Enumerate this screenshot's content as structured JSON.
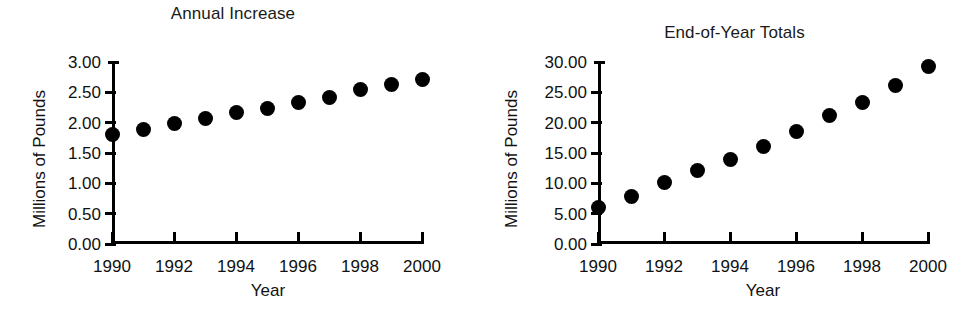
{
  "figure": {
    "background": "#ffffff",
    "marker_color": "#000000",
    "axis_color": "#000000"
  },
  "chart_data": [
    {
      "type": "scatter",
      "title": "Annual Increase",
      "xlabel": "Year",
      "ylabel": "Millions of Pounds",
      "x": [
        1990,
        1991,
        1992,
        1993,
        1994,
        1995,
        1996,
        1997,
        1998,
        1999,
        2000
      ],
      "values": [
        1.8,
        1.88,
        1.98,
        2.07,
        2.17,
        2.23,
        2.33,
        2.42,
        2.55,
        2.63,
        2.71
      ],
      "xlim": [
        1990,
        2000
      ],
      "ylim": [
        0.0,
        3.0
      ],
      "yticks": [
        "0.00",
        "0.50",
        "1.00",
        "1.50",
        "2.00",
        "2.50",
        "3.00"
      ],
      "ytick_values": [
        0.0,
        0.5,
        1.0,
        1.5,
        2.0,
        2.5,
        3.0
      ],
      "xticks": [
        "1990",
        "1992",
        "1994",
        "1996",
        "1998",
        "2000"
      ],
      "xtick_values": [
        1990,
        1992,
        1994,
        1996,
        1998,
        2000
      ],
      "grid": false,
      "legend": false
    },
    {
      "type": "scatter",
      "title": "End-of-Year Totals",
      "xlabel": "Year",
      "ylabel": "Millions of Pounds",
      "x": [
        1990,
        1991,
        1992,
        1993,
        1994,
        1995,
        1996,
        1997,
        1998,
        1999,
        2000
      ],
      "values": [
        6.0,
        7.8,
        10.1,
        12.1,
        13.9,
        16.1,
        18.5,
        21.1,
        23.4,
        26.1,
        29.2
      ],
      "xlim": [
        1990,
        2000
      ],
      "ylim": [
        0.0,
        30.0
      ],
      "yticks": [
        "0.00",
        "5.00",
        "10.00",
        "15.00",
        "20.00",
        "25.00",
        "30.00"
      ],
      "ytick_values": [
        0.0,
        5.0,
        10.0,
        15.0,
        20.0,
        25.0,
        30.0
      ],
      "xticks": [
        "1990",
        "1992",
        "1994",
        "1996",
        "1998",
        "2000"
      ],
      "xtick_values": [
        1990,
        1992,
        1994,
        1996,
        1998,
        2000
      ],
      "grid": false,
      "legend": false
    }
  ]
}
